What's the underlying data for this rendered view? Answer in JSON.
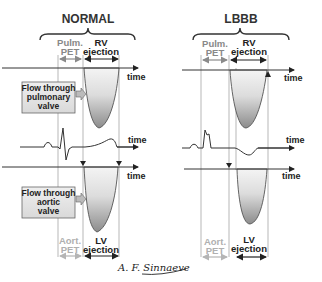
{
  "panels": {
    "normal": {
      "title": "NORMAL",
      "pulm_pet": [
        "Pulm.",
        "PET"
      ],
      "rv_ejection": [
        "RV",
        "ejection"
      ],
      "aort_pet": [
        "Aort.",
        "PET"
      ],
      "lv_ejection": [
        "LV",
        "ejection"
      ],
      "axis_labels": [
        "time",
        "time",
        "time"
      ]
    },
    "lbbb": {
      "title": "LBBB",
      "pulm_pet": [
        "Pulm.",
        "PET"
      ],
      "rv_ejection": [
        "RV",
        "ejection"
      ],
      "aort_pet": [
        "Aort.",
        "PET"
      ],
      "lv_ejection": [
        "LV",
        "ejection"
      ],
      "axis_labels": [
        "time",
        "time",
        "time"
      ]
    }
  },
  "callouts": {
    "pulmonary": [
      "Flow through",
      "pulmonary",
      "valve"
    ],
    "aortic": [
      "Flow through",
      "aortic",
      "valve"
    ]
  },
  "signature": "A. F. Sinnaeve",
  "colors": {
    "line": "#333333",
    "guide": "#9a9a9a",
    "fill_dark": "#8c8c8c",
    "fill_light": "#f0f0f0",
    "box_fill": "#e6e6e6",
    "arrow_grey": "#8a8a8a"
  }
}
